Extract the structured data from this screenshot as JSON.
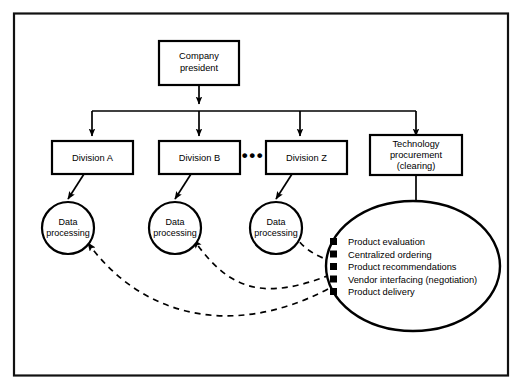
{
  "diagram": {
    "frame": {
      "stroke_color": "#111111"
    },
    "nodes": {
      "president": {
        "label_line1": "Company",
        "label_line2": "president"
      },
      "divisions": [
        {
          "id": "division-a",
          "label_line1": "Division A",
          "label_line2": ""
        },
        {
          "id": "division-b",
          "label_line1": "Division B",
          "label_line2": ""
        },
        {
          "id": "division-z",
          "label_line1": "Division Z",
          "label_line2": ""
        }
      ],
      "ellipsis": "•••",
      "technology_procurement": {
        "label_line1": "Technology",
        "label_line2": "procurement",
        "label_line3": "(clearing)"
      },
      "data_processing": [
        {
          "id": "data-processing-a",
          "label_line1": "Data",
          "label_line2": "processing"
        },
        {
          "id": "data-processing-b",
          "label_line1": "Data",
          "label_line2": "processing"
        },
        {
          "id": "data-processing-z",
          "label_line1": "Data",
          "label_line2": "processing"
        }
      ],
      "clearing_house": {
        "bullets": [
          "Product evaluation",
          "Centralized ordering",
          "Product recommendations",
          "Vendor interfacing (negotiation)",
          "Product delivery"
        ]
      }
    },
    "colors": {
      "stroke": "#000000",
      "background": "#ffffff"
    }
  }
}
